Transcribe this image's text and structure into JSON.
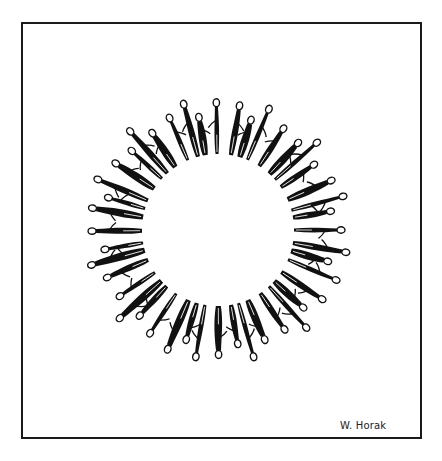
{
  "artwork": {
    "description": "Ink drawing of a ring of human figures holding hands around an empty circle",
    "signature": "W. Horak",
    "figure_count": 44,
    "colors": {
      "ink": "#111111",
      "paper": "#ffffff",
      "frame": "#1a1a1a"
    }
  }
}
